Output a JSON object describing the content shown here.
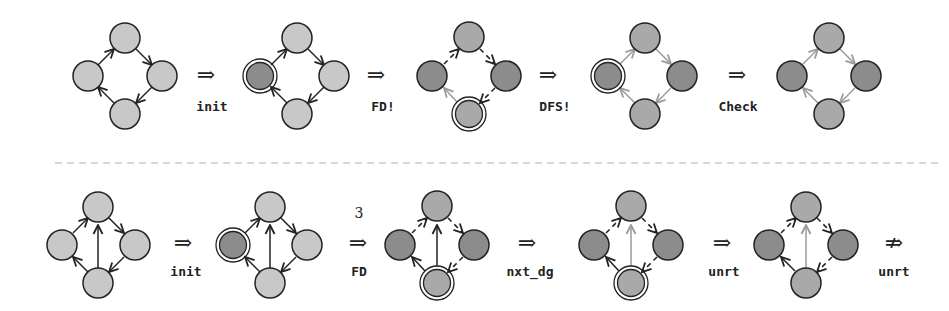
{
  "colors": {
    "light_node": "#c8c8c8",
    "dark_node": "#8c8c8c",
    "mid_node": "#a9a9a9",
    "stroke": "#222222",
    "gray_edge": "#9a9a9a",
    "separator": "#b0b0b0"
  },
  "top_row": {
    "transitions": [
      {
        "arrow": "⇒",
        "label": "init"
      },
      {
        "arrow": "⇒",
        "label": "FD!"
      },
      {
        "arrow": "⇒",
        "label": "DFS!"
      },
      {
        "arrow": "⇒",
        "label": "Check"
      }
    ]
  },
  "bottom_row": {
    "transitions": [
      {
        "arrow": "⇒",
        "label": "init",
        "superscript": ""
      },
      {
        "arrow": "⇒",
        "label": "FD",
        "superscript": "3"
      },
      {
        "arrow": "⇒",
        "label": "nxt_dg",
        "superscript": ""
      },
      {
        "arrow": "⇒",
        "label": "unrt",
        "superscript": ""
      },
      {
        "arrow": "⇏",
        "label": "unrt",
        "superscript": ""
      }
    ]
  }
}
